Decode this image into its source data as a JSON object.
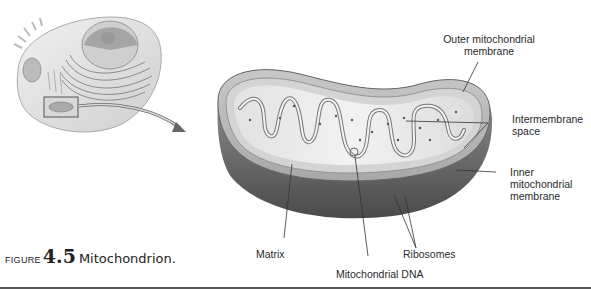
{
  "figure": {
    "caption_prefix": "FIGURE",
    "number": "4.5",
    "title": "Mitochondrion."
  },
  "labels": {
    "outer_membrane": [
      "Outer mitochondrial",
      "membrane"
    ],
    "intermembrane_space": [
      "Intermembrane",
      "space"
    ],
    "inner_membrane": [
      "Inner",
      "mitochondrial",
      "membrane"
    ],
    "matrix": "Matrix",
    "ribosomes": "Ribosomes",
    "mitochondrial_dna": "Mitochondrial DNA"
  },
  "illustrations": {
    "cell": "animal-cell-cutaway",
    "inset_box": "highlighted-mitochondrion-region",
    "arrow": "zoom-arrow",
    "mitochondrion": "mitochondrion-cross-section"
  }
}
